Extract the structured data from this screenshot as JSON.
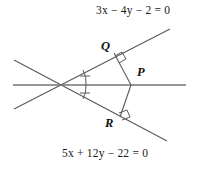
{
  "figure": {
    "background_color": "#ffffff",
    "stroke_color": "#4d4d4d",
    "text_color": "#1a1a1a",
    "width": 203,
    "height": 171
  },
  "equations": {
    "top_line": "3x − 4y − 2 = 0",
    "bottom_line": "5x + 12y − 22 = 0"
  },
  "points": {
    "Q": "Q",
    "P": "P",
    "R": "R"
  },
  "markers": {
    "right_angle_at_Q": "right-angle",
    "right_angle_at_R": "right-angle",
    "equal_angle_ticks": 2
  },
  "geometry": {
    "vertex": {
      "x": 59,
      "y": 84
    },
    "point_P": {
      "x": 131,
      "y": 85
    },
    "point_Q": {
      "x": 114,
      "y": 53
    },
    "point_R": {
      "x": 120,
      "y": 117
    },
    "line_top": {
      "x1": 14,
      "y1": 109,
      "x2": 170,
      "y2": 29
    },
    "line_bottom": {
      "x1": 14,
      "y1": 60,
      "x2": 167,
      "y2": 141
    },
    "line_horizontal": {
      "x1": 13,
      "y1": 85,
      "x2": 186,
      "y2": 85
    }
  }
}
